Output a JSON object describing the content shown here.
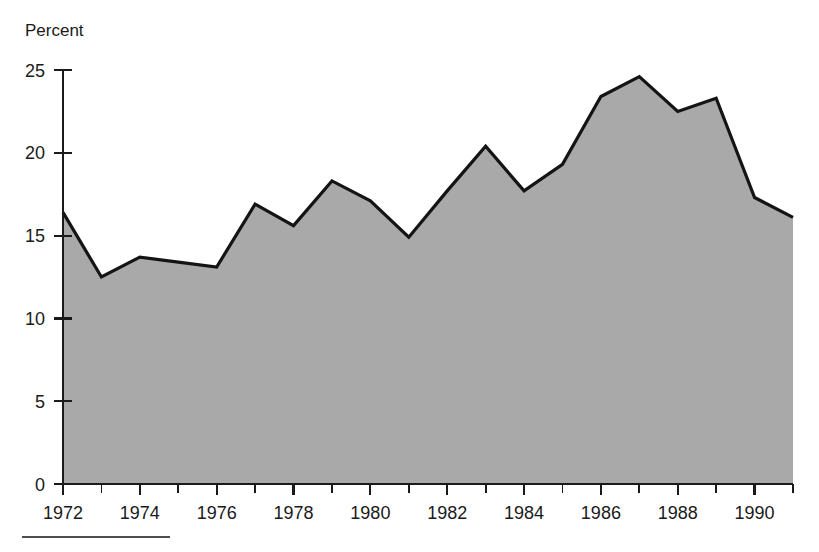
{
  "chart_data": {
    "type": "area",
    "title": "",
    "subtitle": "",
    "xlabel": "",
    "ylabel": "Percent",
    "ylabel_position": "top-left",
    "x": [
      1972,
      1973,
      1974,
      1975,
      1976,
      1977,
      1978,
      1979,
      1980,
      1981,
      1982,
      1983,
      1984,
      1985,
      1986,
      1987,
      1988,
      1989,
      1990,
      1991
    ],
    "values": [
      16.4,
      12.5,
      13.7,
      13.4,
      13.1,
      16.9,
      15.6,
      18.3,
      17.1,
      14.9,
      17.7,
      20.4,
      17.7,
      19.3,
      23.4,
      24.6,
      22.5,
      23.3,
      17.3,
      16.1
    ],
    "series": [
      {
        "name": "Percent",
        "values": [
          16.4,
          12.5,
          13.7,
          13.4,
          13.1,
          16.9,
          15.6,
          18.3,
          17.1,
          14.9,
          17.7,
          20.4,
          17.7,
          19.3,
          23.4,
          24.6,
          22.5,
          23.3,
          17.3,
          16.1
        ]
      }
    ],
    "xlim": [
      1972,
      1991
    ],
    "ylim": [
      0,
      25
    ],
    "ytick_values": [
      0,
      5,
      10,
      15,
      20,
      25
    ],
    "ytick_labels": [
      "0",
      "5",
      "10",
      "15",
      "20",
      "25"
    ],
    "xtick_values": [
      1972,
      1973,
      1974,
      1975,
      1976,
      1977,
      1978,
      1979,
      1980,
      1981,
      1982,
      1983,
      1984,
      1985,
      1986,
      1987,
      1988,
      1989,
      1990,
      1991
    ],
    "xtick_labels_shown": [
      "1972",
      "1974",
      "1976",
      "1978",
      "1980",
      "1982",
      "1984",
      "1986",
      "1988",
      "1990"
    ],
    "xtick_label_values": [
      1972,
      1974,
      1976,
      1978,
      1980,
      1982,
      1984,
      1986,
      1988,
      1990
    ],
    "grid": false,
    "legend": null,
    "legend_position": "none",
    "fill_color": "#a9a9a9",
    "line_color": "#141414",
    "axis_color": "#1a1a1a",
    "background_color": "#ffffff"
  },
  "footer": {
    "rule_visible": true
  }
}
